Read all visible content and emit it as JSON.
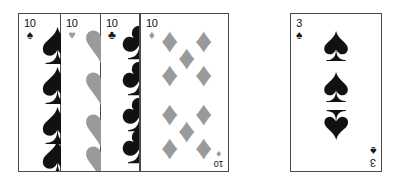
{
  "scene": {
    "description": "Fan of four playing cards beside a single 3 of spades card",
    "background_color": "#ffffff",
    "card_border_color": "#4a4a4a",
    "black_suit_color": "#111111",
    "red_suit_color": "#9a9a9a"
  },
  "fan": {
    "name": "four-card-fan",
    "cards": [
      {
        "rank": "10",
        "suit": "spades",
        "suit_glyph": "♠",
        "color": "#111111",
        "corner_rank": "10",
        "corner_pip": "♠"
      },
      {
        "rank": "10",
        "suit": "hearts",
        "suit_glyph": "♥",
        "color": "#9a9a9a",
        "corner_rank": "10",
        "corner_pip": "♥"
      },
      {
        "rank": "10",
        "suit": "clubs",
        "suit_glyph": "♣",
        "color": "#111111",
        "corner_rank": "10",
        "corner_pip": "♣"
      },
      {
        "rank": "10",
        "suit": "diamonds",
        "suit_glyph": "♦",
        "color": "#9a9a9a",
        "corner_rank": "10",
        "corner_pip": "♦",
        "bottom_corner_rank": "10",
        "bottom_corner_pip": "♦",
        "pip_count": 10
      }
    ]
  },
  "single": {
    "name": "three-of-spades",
    "rank": "3",
    "suit": "spades",
    "suit_glyph": "♠",
    "color": "#111111",
    "corner_rank": "3",
    "corner_pip": "♠",
    "bottom_corner_rank": "3",
    "bottom_corner_pip": "♠",
    "pip_count": 3,
    "pips": [
      "♠",
      "♠",
      "♠"
    ]
  }
}
